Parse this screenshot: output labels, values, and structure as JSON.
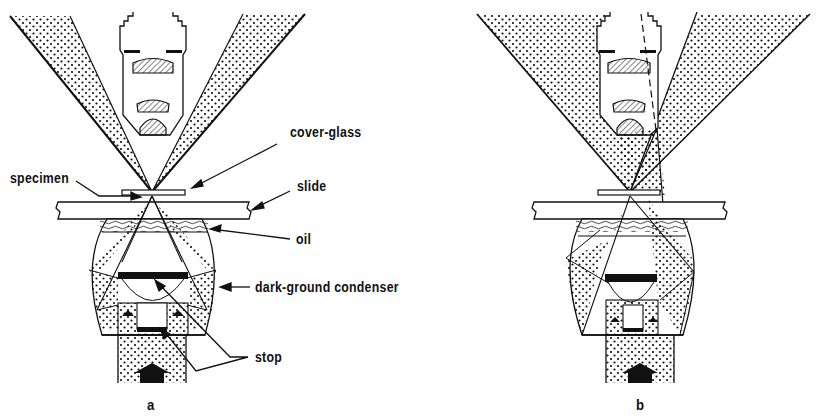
{
  "figure": {
    "type": "dark-ground illumination diagram",
    "panels": [
      {
        "id": "a",
        "label": "a"
      },
      {
        "id": "b",
        "label": "b"
      }
    ],
    "labels": {
      "cover_glass": "cover-glass",
      "specimen": "specimen",
      "slide": "slide",
      "oil": "oil",
      "condenser": "dark-ground condenser",
      "stop": "stop"
    },
    "colors": {
      "ink": "#111111",
      "paper": "#ffffff",
      "hatch": "#555555"
    }
  }
}
